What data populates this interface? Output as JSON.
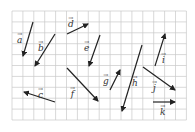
{
  "grid": {
    "x0": 12,
    "y0": 11,
    "cell": 10.9,
    "cols": 16,
    "rows": 10,
    "color": "#c8c8c8"
  },
  "vector_color": "#222222",
  "vectors": [
    {
      "name": "a",
      "label": "a",
      "x1": 33,
      "y1": 22,
      "x2": 23,
      "y2": 56,
      "lx": 17,
      "ly": 32
    },
    {
      "name": "b",
      "label": "b",
      "x1": 55,
      "y1": 34,
      "x2": 35,
      "y2": 66,
      "lx": 38,
      "ly": 40
    },
    {
      "name": "d",
      "label": "d",
      "x1": 67,
      "y1": 34,
      "x2": 88,
      "y2": 24,
      "lx": 68,
      "ly": 16
    },
    {
      "name": "e",
      "label": "e",
      "x1": 100,
      "y1": 35,
      "x2": 89,
      "y2": 66,
      "lx": 84,
      "ly": 40
    },
    {
      "name": "c",
      "label": "c",
      "x1": 55,
      "y1": 102,
      "x2": 24,
      "y2": 92,
      "lx": 38,
      "ly": 87
    },
    {
      "name": "f",
      "label": "f",
      "x1": 67,
      "y1": 68,
      "x2": 98,
      "y2": 101,
      "lx": 70,
      "ly": 86
    },
    {
      "name": "g",
      "label": "g",
      "x1": 110,
      "y1": 90,
      "x2": 120,
      "y2": 70,
      "lx": 103,
      "ly": 73
    },
    {
      "name": "h",
      "label": "h",
      "x1": 142,
      "y1": 45,
      "x2": 122,
      "y2": 111,
      "lx": 132,
      "ly": 75
    },
    {
      "name": "i",
      "label": "i",
      "x1": 155,
      "y1": 66,
      "x2": 165,
      "y2": 34,
      "lx": 161,
      "ly": 52
    },
    {
      "name": "j",
      "label": "j",
      "x1": 143,
      "y1": 67,
      "x2": 175,
      "y2": 90,
      "lx": 152,
      "ly": 80
    },
    {
      "name": "k",
      "label": "k",
      "x1": 153,
      "y1": 102,
      "x2": 175,
      "y2": 102,
      "lx": 160,
      "ly": 104
    }
  ]
}
